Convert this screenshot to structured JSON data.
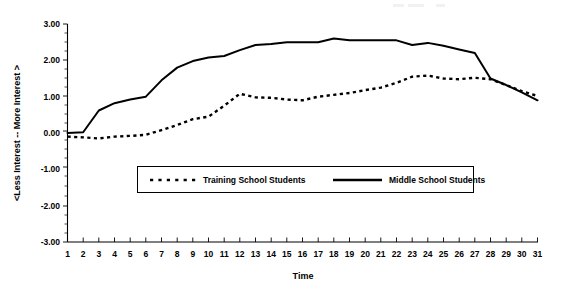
{
  "chart_data": {
    "type": "line",
    "title": "",
    "xlabel": "Time",
    "ylabel": "<Less Interest  --  More Interest >",
    "x": [
      1,
      2,
      3,
      4,
      5,
      6,
      7,
      8,
      9,
      10,
      11,
      12,
      13,
      14,
      15,
      16,
      17,
      18,
      19,
      20,
      21,
      22,
      23,
      24,
      25,
      26,
      27,
      28,
      29,
      30,
      31
    ],
    "xlim": [
      1,
      31
    ],
    "ylim": [
      -3.0,
      3.0
    ],
    "ytick_labels": [
      "3.00",
      "2.00",
      "1.00",
      "0.00",
      "-1.00",
      "-2.00",
      "-3.00"
    ],
    "ytick_values": [
      3.0,
      2.0,
      1.0,
      0.0,
      -1.0,
      -2.0,
      -3.0
    ],
    "xtick_labels": [
      "1",
      "2",
      "3",
      "4",
      "5",
      "6",
      "7",
      "8",
      "9",
      "10",
      "11",
      "12",
      "13",
      "14",
      "15",
      "16",
      "17",
      "18",
      "19",
      "20",
      "21",
      "22",
      "23",
      "24",
      "25",
      "26",
      "27",
      "28",
      "29",
      "30",
      "31"
    ],
    "grid": false,
    "legend_position": "inside-center",
    "series": [
      {
        "name": "Training School Students",
        "style": "dotted",
        "color": "#000000",
        "values": [
          -0.1,
          -0.12,
          -0.15,
          -0.1,
          -0.08,
          -0.05,
          0.08,
          0.22,
          0.38,
          0.45,
          0.75,
          1.08,
          0.98,
          0.97,
          0.92,
          0.9,
          1.0,
          1.05,
          1.1,
          1.18,
          1.25,
          1.38,
          1.55,
          1.58,
          1.5,
          1.48,
          1.52,
          1.48,
          1.32,
          1.15,
          1.02
        ]
      },
      {
        "name": "Middle School Students",
        "style": "solid",
        "color": "#000000",
        "values": [
          0.0,
          0.02,
          0.62,
          0.82,
          0.92,
          1.0,
          1.45,
          1.8,
          1.98,
          2.08,
          2.12,
          2.28,
          2.42,
          2.45,
          2.5,
          2.5,
          2.5,
          2.6,
          2.55,
          2.55,
          2.55,
          2.55,
          2.42,
          2.48,
          2.4,
          2.3,
          2.2,
          1.5,
          1.32,
          1.12,
          0.9
        ]
      }
    ]
  },
  "legend": {
    "entries": [
      {
        "label": "Training School Students",
        "marker": "dotted-line"
      },
      {
        "label": "Middle School Students",
        "marker": "solid-line"
      }
    ]
  },
  "axes": {
    "x_title": "Time",
    "y_title": "<Less Interest  --  More Interest >"
  }
}
